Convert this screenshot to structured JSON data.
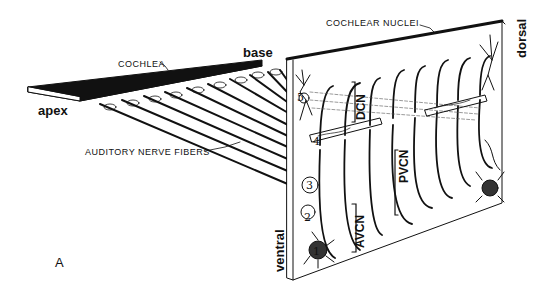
{
  "figure": {
    "panel_label": "A",
    "labels": {
      "cochlea": "COCHLEA",
      "base": "base",
      "apex": "apex",
      "auditory_nerve_fibers": "AUDITORY NERVE FIBERS",
      "cochlear_nuclei": "COCHLEAR NUCLEI",
      "dorsal": "dorsal",
      "ventral": "ventral",
      "dcn": "DCN",
      "pvcn": "PVCN",
      "avcn": "AVCN"
    },
    "cell_numbers": [
      "1",
      "2",
      "3",
      "4",
      "5"
    ],
    "colors": {
      "ink": "#111111",
      "background": "#ffffff"
    }
  }
}
